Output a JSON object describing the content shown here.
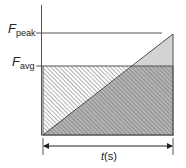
{
  "diagram": {
    "y_labels": {
      "peak": {
        "main": "F",
        "sub": "peak"
      },
      "avg": {
        "main": "F",
        "sub": "avg"
      }
    },
    "x_label": {
      "italic": "t",
      "rest": "(s)"
    },
    "colors": {
      "axis": "#555555",
      "hatch": "#6e6e6e",
      "dark_fill": "#b4b4b4",
      "light_fill": "#d3d3d3",
      "background": "#ffffff"
    },
    "shapes": {
      "avg_rectangle": "hatched rectangle from 0 to F_avg over duration t",
      "ramp_triangle": "shaded triangle rising linearly from 0 to F_peak over duration t",
      "excess_region": "light gray triangle where ramp exceeds F_avg"
    }
  }
}
